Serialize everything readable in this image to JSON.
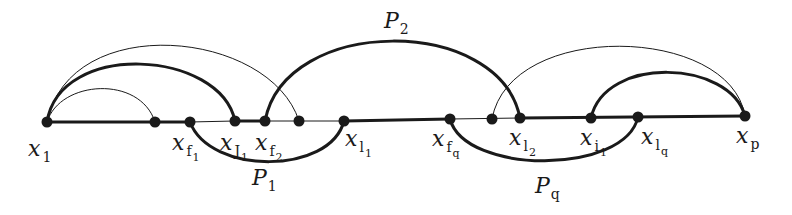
{
  "diagram": {
    "colors": {
      "ink": "#1a1a1a",
      "background": "#ffffff"
    },
    "nodes": [
      {
        "id": "x1",
        "x": 47,
        "y": 122,
        "label": "x",
        "sub": "1",
        "subsub": "",
        "lx": 28,
        "ly": 156
      },
      {
        "id": "u1",
        "x": 155,
        "y": 122,
        "label": "",
        "sub": "",
        "subsub": ""
      },
      {
        "id": "xf1",
        "x": 190,
        "y": 122,
        "label": "x",
        "sub": "f",
        "subsub": "1",
        "lx": 172,
        "ly": 150
      },
      {
        "id": "xj1",
        "x": 235,
        "y": 121,
        "label": "x",
        "sub": "J",
        "subsub": "1",
        "lx": 220,
        "ly": 150
      },
      {
        "id": "xf2",
        "x": 265,
        "y": 121,
        "label": "x",
        "sub": "f",
        "subsub": "2",
        "lx": 255,
        "ly": 150
      },
      {
        "id": "u2",
        "x": 299,
        "y": 121,
        "label": "",
        "sub": "",
        "subsub": ""
      },
      {
        "id": "xl1",
        "x": 344,
        "y": 121,
        "label": "x",
        "sub": "l",
        "subsub": "1",
        "lx": 345,
        "ly": 146
      },
      {
        "id": "xfq",
        "x": 450,
        "y": 119,
        "label": "x",
        "sub": "f",
        "subsub": "q",
        "lx": 432,
        "ly": 146
      },
      {
        "id": "u3",
        "x": 492,
        "y": 119,
        "label": "",
        "sub": "",
        "subsub": ""
      },
      {
        "id": "xl2",
        "x": 520,
        "y": 118,
        "label": "x",
        "sub": "l",
        "subsub": "2",
        "lx": 509,
        "ly": 145
      },
      {
        "id": "xi1",
        "x": 591,
        "y": 118,
        "label": "x",
        "sub": "i",
        "subsub": "1",
        "lx": 580,
        "ly": 145
      },
      {
        "id": "xlq",
        "x": 638,
        "y": 117,
        "label": "x",
        "sub": "l",
        "subsub": "q",
        "lx": 641,
        "ly": 144
      },
      {
        "id": "xp",
        "x": 745,
        "y": 116,
        "label": "x",
        "sub": "p",
        "subsub": "",
        "lx": 736,
        "ly": 143
      }
    ],
    "paths": [
      {
        "label": "P",
        "sub": "1",
        "from": "xf1",
        "to": "xl1",
        "lx": 252,
        "ly": 185
      },
      {
        "label": "P",
        "sub": "2",
        "from": "xf2",
        "to": "xl2",
        "lx": 384,
        "ly": 28
      },
      {
        "label": "P",
        "sub": "q",
        "from": "xfq",
        "to": "xlq",
        "lx": 535,
        "ly": 193
      }
    ]
  }
}
